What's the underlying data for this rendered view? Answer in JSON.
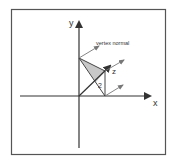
{
  "diagram": {
    "axes": {
      "x_label": "x",
      "y_label": "y",
      "z_label": "z"
    },
    "annotations": {
      "vertex_normal_label": "vertex normal",
      "triangle_label": "2"
    },
    "colors": {
      "frame": "#555555",
      "axis": "#333333",
      "triangle_fill": "#c8c8c8",
      "normal_arrow": "#666666",
      "background": "#ffffff"
    }
  }
}
